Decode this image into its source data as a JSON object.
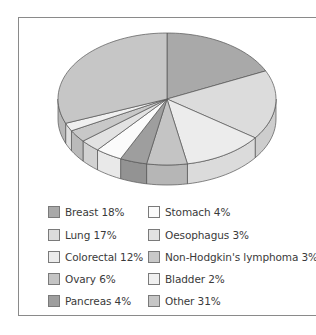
{
  "chart_data": {
    "type": "pie",
    "style": "3d",
    "title": "",
    "start_angle_deg": 0,
    "direction": "clockwise",
    "categories": [
      "Breast",
      "Lung",
      "Colorectal",
      "Ovary",
      "Pancreas",
      "Stomach",
      "Oesophagus",
      "Non-Hodgkin's lymphoma",
      "Bladder",
      "Other"
    ],
    "values": [
      18,
      17,
      12,
      6,
      4,
      4,
      3,
      3,
      2,
      31
    ],
    "unit": "%",
    "colors": [
      "#a9a9a9",
      "#dcdcdc",
      "#ececec",
      "#c4c4c4",
      "#9e9e9e",
      "#fbfbfb",
      "#e2e2e2",
      "#c8c8c8",
      "#f0f0f0",
      "#c6c6c6"
    ],
    "legend_position": "bottom",
    "legend": [
      {
        "label": "Breast 18%",
        "color": "#a9a9a9"
      },
      {
        "label": "Lung 17%",
        "color": "#dcdcdc"
      },
      {
        "label": "Colorectal 12%",
        "color": "#ececec"
      },
      {
        "label": "Ovary 6%",
        "color": "#c4c4c4"
      },
      {
        "label": "Pancreas 4%",
        "color": "#9e9e9e"
      },
      {
        "label": "Stomach 4%",
        "color": "#fbfbfb"
      },
      {
        "label": "Oesophagus 3%",
        "color": "#e2e2e2"
      },
      {
        "label": "Non-Hodgkin's lymphoma 3%",
        "color": "#c8c8c8"
      },
      {
        "label": "Bladder 2%",
        "color": "#f0f0f0"
      },
      {
        "label": "Other 31%",
        "color": "#c6c6c6"
      }
    ]
  }
}
